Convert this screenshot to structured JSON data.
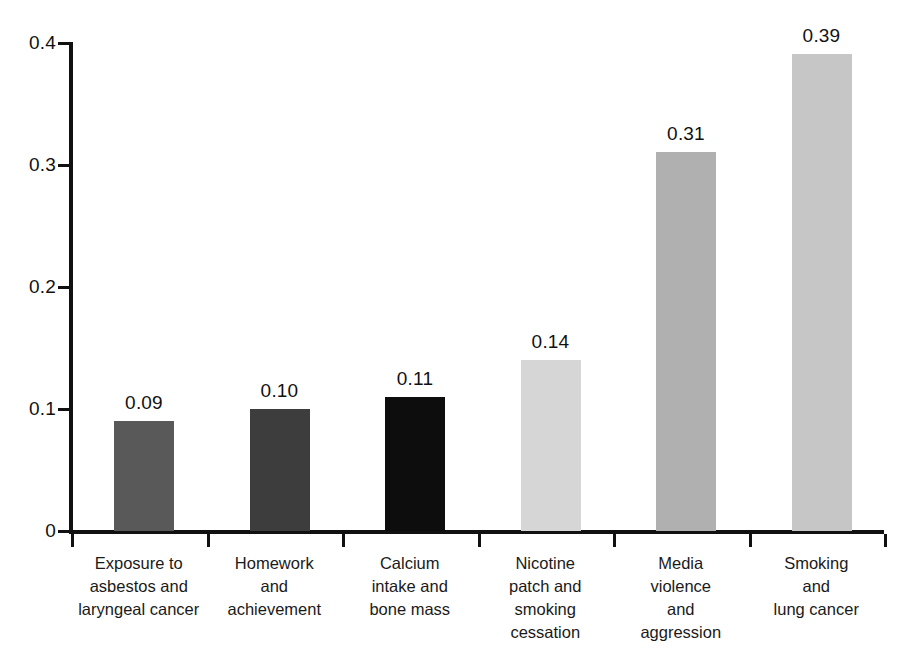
{
  "chart_data": {
    "type": "bar",
    "title": "",
    "subtitle": "",
    "xlabel": "",
    "ylabel": "",
    "grid": false,
    "legend": null,
    "ylim": [
      0,
      0.4
    ],
    "ytick_labels": [
      "0",
      "0.1",
      "0.2",
      "0.3",
      "0.4"
    ],
    "ytick_values": [
      0,
      0.1,
      0.2,
      0.3,
      0.4
    ],
    "categories": [
      "Exposure to asbestos and laryngeal cancer",
      "Homework and achievement",
      "Calcium intake and bone mass",
      "Nicotine patch and smoking cessation",
      "Media violence and aggression",
      "Smoking and lung cancer"
    ],
    "category_lines": [
      [
        "Exposure to",
        "asbestos and",
        "laryngeal cancer"
      ],
      [
        "Homework",
        "and",
        "achievement"
      ],
      [
        "Calcium",
        "intake and",
        "bone mass"
      ],
      [
        "Nicotine",
        "patch and",
        "smoking",
        "cessation"
      ],
      [
        "Media",
        "violence",
        "and",
        "aggression"
      ],
      [
        "Smoking",
        "and",
        "lung cancer"
      ]
    ],
    "values": [
      0.09,
      0.1,
      0.11,
      0.14,
      0.31,
      0.39
    ],
    "value_labels": [
      "0.09",
      "0.10",
      "0.11",
      "0.14",
      "0.31",
      "0.39"
    ],
    "bar_colors": [
      "#595959",
      "#3d3d3d",
      "#0d0d0d",
      "#d6d6d6",
      "#b0b0b0",
      "#c6c6c6"
    ],
    "axis_color": "#111111"
  }
}
